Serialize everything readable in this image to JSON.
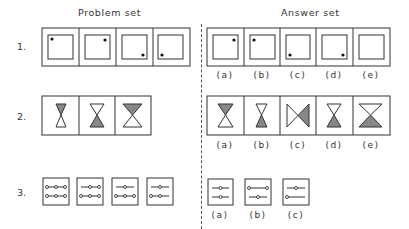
{
  "headings": {
    "problem_set": "Problem set",
    "answer_set": "Answer set"
  },
  "rows": [
    {
      "number": "1.",
      "problem": [
        {
          "figure": "square-in-square",
          "dot": "top-left"
        },
        {
          "figure": "square-in-square",
          "dot": "top-right"
        },
        {
          "figure": "square-in-square",
          "dot": "bottom-right"
        },
        {
          "figure": "square-in-square",
          "dot": "bottom-left"
        }
      ],
      "answers": [
        {
          "label": "(a)",
          "figure": "square-in-square",
          "dot": "top-right"
        },
        {
          "label": "(b)",
          "figure": "square-in-square",
          "dot": "top-left"
        },
        {
          "label": "(c)",
          "figure": "square-in-square",
          "dot": "bottom-left"
        },
        {
          "label": "(d)",
          "figure": "square-in-square",
          "dot": "bottom-right"
        },
        {
          "label": "(e)",
          "figure": "square-in-square",
          "dot": "none"
        }
      ]
    },
    {
      "number": "2.",
      "problem": [
        {
          "figure": "hourglass",
          "size": "small",
          "shaded": "top"
        },
        {
          "figure": "hourglass",
          "size": "medium",
          "shaded": "bottom"
        },
        {
          "figure": "hourglass",
          "size": "large",
          "shaded": "top"
        }
      ],
      "answers": [
        {
          "label": "(a)",
          "figure": "hourglass",
          "size": "medium",
          "shaded": "top"
        },
        {
          "label": "(b)",
          "figure": "hourglass",
          "size": "small",
          "shaded": "bottom"
        },
        {
          "label": "(c)",
          "figure": "bowtie",
          "size": "medium",
          "shaded": "right"
        },
        {
          "label": "(d)",
          "figure": "hourglass",
          "size": "medium",
          "shaded": "bottom"
        },
        {
          "label": "(e)",
          "figure": "hourglass",
          "size": "large",
          "shaded": "bottom"
        }
      ]
    },
    {
      "number": "3.",
      "problem": [
        {
          "figure": "bead-lines",
          "top_line": "o-o-o",
          "bottom_line": "o-o-o"
        },
        {
          "figure": "bead-lines",
          "top_line": "-o-o",
          "bottom_line": "o-o-o"
        },
        {
          "figure": "bead-lines",
          "top_line": "-o-",
          "bottom_line": "o-o-o"
        },
        {
          "figure": "bead-lines",
          "top_line": "-o-",
          "bottom_line": "o-o-"
        }
      ],
      "answers": [
        {
          "label": "(a)",
          "figure": "bead-lines",
          "top_line": "-o-",
          "bottom_line": "-o-"
        },
        {
          "label": "(b)",
          "figure": "bead-lines",
          "top_line": "o--o",
          "bottom_line": "-o-"
        },
        {
          "label": "(c)",
          "figure": "bead-lines",
          "top_line": "-o-",
          "bottom_line": "o--"
        }
      ]
    }
  ]
}
